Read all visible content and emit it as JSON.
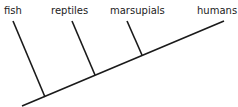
{
  "diagram": {
    "type": "cladogram",
    "taxa": [
      {
        "name": "fish"
      },
      {
        "name": "reptiles"
      },
      {
        "name": "marsupials"
      },
      {
        "name": "humans"
      }
    ],
    "line_color": "#1a1a1a",
    "text_color": "#222222"
  }
}
